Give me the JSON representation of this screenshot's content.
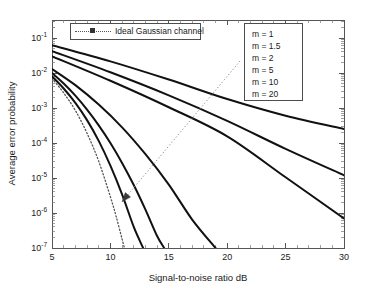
{
  "chart_data": {
    "type": "line",
    "title": "",
    "xlabel": "Signal-to-noise ratio dB",
    "ylabel": "Average error probability",
    "xlim": [
      5,
      30
    ],
    "ylim": [
      1e-07,
      0.2
    ],
    "yscale": "log",
    "grid": false,
    "xticks": [
      5,
      10,
      15,
      20,
      25,
      30
    ],
    "xtick_labels": [
      "5",
      "10",
      "15",
      "20",
      "25",
      "30"
    ],
    "yticks": [
      0.1,
      0.01,
      0.001,
      0.0001,
      1e-05,
      1e-06,
      1e-07
    ],
    "ytick_labels": [
      "10-1",
      "10-2",
      "10-3",
      "10-4",
      "10-5",
      "10-6",
      "10-7"
    ],
    "ytick_mantissas": [
      "10",
      "10",
      "10",
      "10",
      "10",
      "10",
      "10"
    ],
    "ytick_exponents": [
      "-1",
      "-2",
      "-3",
      "-4",
      "-5",
      "-6",
      "-7"
    ],
    "legend_position": "upper-left and upper-right",
    "series": [
      {
        "name": "Ideal Gaussian channel",
        "style": "dotted",
        "x": [
          5,
          6,
          7,
          8,
          9,
          10,
          10.5,
          11,
          11.2
        ],
        "values": [
          0.007,
          0.0027,
          0.00085,
          0.00019,
          3e-05,
          2.9e-06,
          7.8e-07,
          1.8e-07,
          1e-07
        ]
      },
      {
        "name": "m = 20",
        "style": "solid",
        "x": [
          5,
          6,
          7,
          8,
          9,
          10,
          11,
          12,
          12.8
        ],
        "values": [
          0.008,
          0.0036,
          0.0014,
          0.00045,
          0.000115,
          2.25e-05,
          3.4e-06,
          4e-07,
          1e-07
        ]
      },
      {
        "name": "m = 10",
        "style": "solid",
        "x": [
          5,
          6,
          7,
          8,
          9,
          10,
          11,
          12,
          13,
          14,
          14.6
        ],
        "values": [
          0.01,
          0.005,
          0.00225,
          0.0009,
          0.00032,
          0.0001,
          2.7e-05,
          6.3e-06,
          1.25e-06,
          2.2e-07,
          1e-07
        ]
      },
      {
        "name": "m = 5",
        "style": "solid",
        "x": [
          5,
          7,
          9,
          11,
          13,
          15,
          17,
          19
        ],
        "values": [
          0.013,
          0.0045,
          0.00125,
          0.00028,
          4.8e-05,
          6.5e-06,
          6.5e-07,
          1e-07
        ]
      },
      {
        "name": "m = 2",
        "style": "solid",
        "x": [
          5,
          10,
          15,
          20,
          25,
          30
        ],
        "values": [
          0.03,
          0.006,
          0.00105,
          0.000155,
          1.05e-05,
          7e-07
        ]
      },
      {
        "name": "m = 1.5",
        "style": "solid",
        "x": [
          5,
          10,
          15,
          20,
          25,
          30
        ],
        "values": [
          0.042,
          0.0105,
          0.0023,
          0.00043,
          6.8e-05,
          1.2e-05
        ]
      },
      {
        "name": "m = 1",
        "style": "solid",
        "x": [
          5,
          10,
          15,
          20,
          25,
          30
        ],
        "values": [
          0.062,
          0.0215,
          0.0065,
          0.0018,
          0.0006,
          0.00025
        ]
      }
    ],
    "annotation": {
      "type": "arrow",
      "note": "dotted arrow indicating direction of increasing m",
      "from": [
        21.1,
        0.022
      ],
      "to": [
        11.0,
        2.1e-06
      ]
    }
  },
  "legend_ideal": {
    "label": "Ideal Gaussian channel",
    "marker": "square-marker",
    "line_style": "dotted"
  },
  "legend_m": {
    "entries": [
      {
        "label": "m = 1"
      },
      {
        "label": "m = 1.5"
      },
      {
        "label": "m = 2"
      },
      {
        "label": "m = 5"
      },
      {
        "label": "m = 10"
      },
      {
        "label": "m = 20"
      }
    ]
  },
  "axes": {
    "x_title": "Signal-to-noise ratio dB",
    "y_title": "Average error probability"
  },
  "colors": {
    "curve": "#111111",
    "ideal": "#555555",
    "axis": "#555555",
    "background": "#ffffff"
  }
}
